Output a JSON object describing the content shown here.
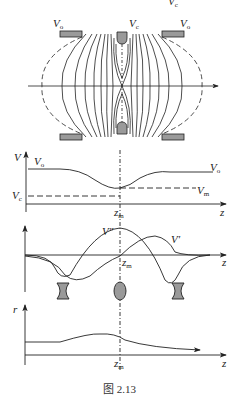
{
  "figure": {
    "caption": "图 2.13",
    "top_label": {
      "main": "V",
      "sub": "c"
    },
    "electrode_labels": {
      "left": {
        "main": "V",
        "sub": "o"
      },
      "center": {
        "main": "V",
        "sub": "c"
      },
      "right": {
        "main": "V",
        "sub": "o"
      }
    },
    "panel_potential": {
      "y_axis": "V",
      "x_axis": "z",
      "left_curve_label": {
        "main": "V",
        "sub": "o"
      },
      "right_curve_label": {
        "main": "V",
        "sub": "o"
      },
      "vc_label": {
        "main": "V",
        "sub": "c"
      },
      "vm_label": {
        "main": "V",
        "sub": "m"
      },
      "zm_label": {
        "main": "z",
        "sub": "m"
      }
    },
    "panel_derivatives": {
      "x_axis": "z",
      "second_derivative_label": "V″",
      "first_derivative_label": "V′",
      "zm_label": {
        "main": "z",
        "sub": "m"
      },
      "lens_icons": [
        "diverging-lens",
        "converging-lens",
        "diverging-lens"
      ]
    },
    "panel_trajectory": {
      "y_axis": "r",
      "x_axis": "z",
      "zm_label": {
        "main": "z",
        "sub": "m"
      }
    },
    "colors": {
      "line": "#222222",
      "electrode_fill": "#9a9a9a",
      "background": "#ffffff"
    }
  }
}
